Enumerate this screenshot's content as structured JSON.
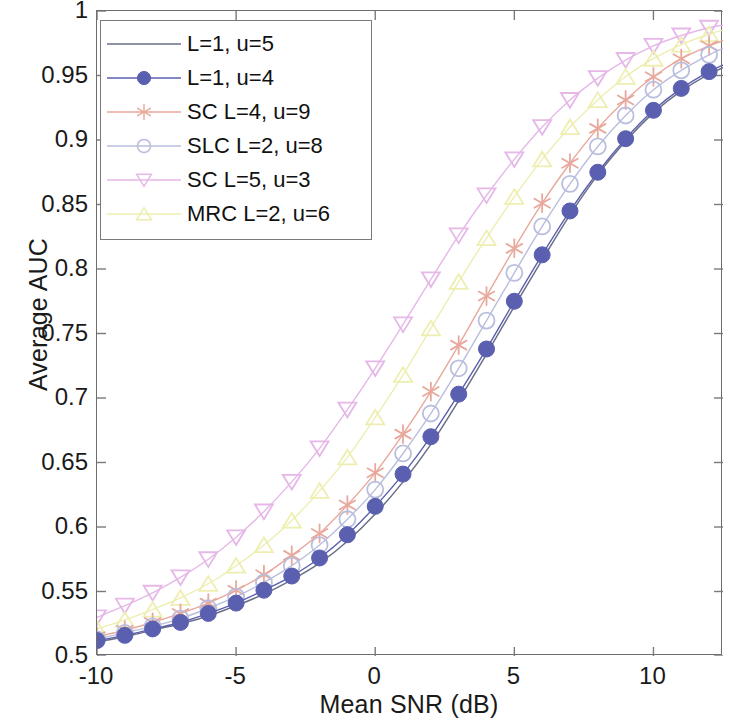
{
  "chart_data": {
    "type": "line",
    "title": "",
    "xlabel": "Mean SNR (dB)",
    "ylabel": "Average AUC",
    "xlim": [
      -10,
      12.5
    ],
    "ylim": [
      0.5,
      1
    ],
    "xticks": [
      "-10",
      "-5",
      "0",
      "5",
      "10"
    ],
    "xtick_values": [
      -10,
      -5,
      0,
      5,
      10
    ],
    "yticks": [
      "0.5",
      "0.55",
      "0.6",
      "0.65",
      "0.7",
      "0.75",
      "0.8",
      "0.85",
      "0.9",
      "0.95",
      "1"
    ],
    "ytick_values": [
      0.5,
      0.55,
      0.6,
      0.65,
      0.7,
      0.75,
      0.8,
      0.85,
      0.9,
      0.95,
      1
    ],
    "grid": false,
    "legend_position": "upper-left",
    "x": [
      -10,
      -9,
      -8,
      -7,
      -6,
      -5,
      -4,
      -3,
      -2,
      -1,
      0,
      1,
      2,
      3,
      4,
      5,
      6,
      7,
      8,
      9,
      10,
      11,
      12,
      12.5
    ],
    "series": [
      {
        "name": "L=1, u=5",
        "color": "#6a6f86",
        "marker": "none",
        "values": [
          0.511,
          0.515,
          0.52,
          0.525,
          0.531,
          0.539,
          0.548,
          0.559,
          0.572,
          0.589,
          0.61,
          0.635,
          0.664,
          0.698,
          0.734,
          0.771,
          0.807,
          0.842,
          0.873,
          0.899,
          0.921,
          0.938,
          0.951,
          0.956
        ]
      },
      {
        "name": "L=1, u=4",
        "color": "#5a5fb0",
        "marker": "filled-circle",
        "values": [
          0.512,
          0.516,
          0.521,
          0.526,
          0.533,
          0.541,
          0.551,
          0.562,
          0.576,
          0.594,
          0.616,
          0.641,
          0.67,
          0.703,
          0.738,
          0.775,
          0.811,
          0.845,
          0.875,
          0.901,
          0.923,
          0.94,
          0.953,
          0.958
        ]
      },
      {
        "name": "SC L=4, u=9",
        "color": "#e8a89c",
        "marker": "asterisk",
        "values": [
          0.515,
          0.52,
          0.526,
          0.533,
          0.541,
          0.551,
          0.563,
          0.578,
          0.595,
          0.617,
          0.642,
          0.672,
          0.705,
          0.741,
          0.779,
          0.816,
          0.851,
          0.882,
          0.909,
          0.931,
          0.949,
          0.963,
          0.973,
          0.977
        ]
      },
      {
        "name": "SLC L=2, u=8",
        "color": "#b9bede",
        "marker": "open-circle",
        "values": [
          0.513,
          0.518,
          0.523,
          0.529,
          0.537,
          0.546,
          0.557,
          0.57,
          0.586,
          0.606,
          0.629,
          0.657,
          0.688,
          0.723,
          0.76,
          0.797,
          0.833,
          0.866,
          0.895,
          0.919,
          0.939,
          0.954,
          0.966,
          0.971
        ]
      },
      {
        "name": "SC L=5, u=3",
        "color": "#e5b8e8",
        "marker": "down-triangle",
        "values": [
          0.53,
          0.539,
          0.549,
          0.561,
          0.575,
          0.592,
          0.612,
          0.635,
          0.661,
          0.691,
          0.723,
          0.757,
          0.792,
          0.826,
          0.857,
          0.885,
          0.91,
          0.931,
          0.948,
          0.962,
          0.973,
          0.981,
          0.987,
          0.989
        ]
      },
      {
        "name": "MRC L=2, u=6",
        "color": "#eeeeb0",
        "marker": "up-triangle",
        "values": [
          0.521,
          0.528,
          0.536,
          0.545,
          0.556,
          0.57,
          0.586,
          0.605,
          0.628,
          0.654,
          0.685,
          0.718,
          0.754,
          0.79,
          0.824,
          0.856,
          0.885,
          0.91,
          0.931,
          0.949,
          0.963,
          0.974,
          0.982,
          0.985
        ]
      }
    ]
  },
  "legend": {
    "items": [
      {
        "label": "L=1, u=5"
      },
      {
        "label": "L=1, u=4"
      },
      {
        "label": "SC L=4, u=9"
      },
      {
        "label": "SLC L=2, u=8"
      },
      {
        "label": "SC L=5, u=3"
      },
      {
        "label": "MRC L=2, u=6"
      }
    ]
  }
}
